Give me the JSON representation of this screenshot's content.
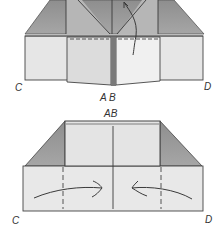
{
  "diagram": {
    "type": "origami-folding-steps",
    "colors": {
      "paper_light": "#e4e4e4",
      "paper_dark": "#9a9a9a",
      "line": "#3a3a3a",
      "background": "#ffffff"
    },
    "step_top": {
      "labels": {
        "corner_left": "C",
        "corner_right": "D",
        "center_bottom": "A B"
      }
    },
    "step_bottom": {
      "labels": {
        "top_center": "AB",
        "corner_left": "C",
        "corner_right": "D"
      },
      "arrows": [
        "fold-in-left",
        "fold-in-right"
      ]
    }
  }
}
